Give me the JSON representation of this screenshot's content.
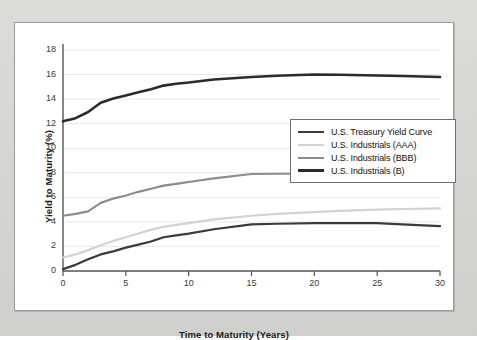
{
  "figure": {
    "background_color": "#d8d8d6",
    "panel_color": "#ffffff",
    "panel_border_color": "#9a9a9a"
  },
  "chart_data": {
    "type": "line",
    "title": "",
    "xlabel": "Time to Maturity (Years)",
    "ylabel": "Yield to Maturity (%)",
    "xlim": [
      0,
      30
    ],
    "ylim": [
      0,
      18
    ],
    "xticks": [
      0,
      5,
      10,
      15,
      20,
      25,
      30
    ],
    "yticks": [
      0,
      2,
      4,
      6,
      8,
      10,
      12,
      14,
      16,
      18
    ],
    "grid": "horizontal",
    "grid_color": "#e8e8e8",
    "legend_position": "center-right",
    "x": [
      0,
      1,
      2,
      3,
      4,
      5,
      6,
      7,
      8,
      9,
      10,
      12,
      15,
      17,
      20,
      22,
      25,
      27,
      30
    ],
    "series": [
      {
        "name": "U.S. Treasury Yield Curve",
        "color": "#3a3a3a",
        "width": 2.2,
        "values": [
          0.15,
          0.5,
          0.95,
          1.35,
          1.6,
          1.9,
          2.15,
          2.4,
          2.75,
          2.9,
          3.05,
          3.4,
          3.8,
          3.85,
          3.9,
          3.9,
          3.9,
          3.8,
          3.65
        ]
      },
      {
        "name": "U.S. Industrials (AAA)",
        "color": "#d2d2d2",
        "width": 2.2,
        "values": [
          1.1,
          1.35,
          1.7,
          2.1,
          2.45,
          2.75,
          3.05,
          3.35,
          3.6,
          3.75,
          3.9,
          4.2,
          4.5,
          4.65,
          4.8,
          4.9,
          5.0,
          5.05,
          5.1
        ]
      },
      {
        "name": "U.S. Industrials (BBB)",
        "color": "#8c8c8c",
        "width": 2.2,
        "values": [
          4.5,
          4.65,
          4.85,
          5.55,
          5.9,
          6.15,
          6.45,
          6.7,
          6.95,
          7.1,
          7.25,
          7.55,
          7.9,
          7.92,
          7.92,
          7.9,
          7.85,
          7.75,
          7.6
        ]
      },
      {
        "name": "U.S. Industrials (B)",
        "color": "#2b2b2b",
        "width": 2.6,
        "values": [
          12.2,
          12.45,
          12.95,
          13.7,
          14.05,
          14.3,
          14.55,
          14.8,
          15.1,
          15.25,
          15.35,
          15.6,
          15.8,
          15.9,
          16.0,
          15.98,
          15.92,
          15.88,
          15.8
        ]
      }
    ]
  }
}
